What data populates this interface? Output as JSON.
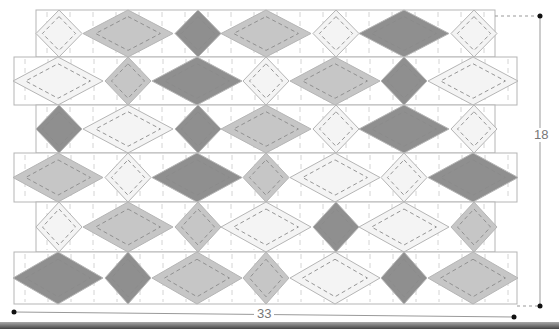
{
  "diagram": {
    "type": "quilt-layout",
    "dimensions": {
      "width_label": "33",
      "height_label": "18"
    },
    "colors": {
      "dark": "#8f8f8f",
      "medium": "#c6c6c6",
      "light": "#f4f4f4",
      "outline": "#b5b5b5",
      "stitch": "#8a8a8a",
      "grid": "#c9c9c9"
    },
    "rows": [
      {
        "x0": 36,
        "x1": 495,
        "y0": 10,
        "y1": 57,
        "pieces": [
          [
            "light",
            "s"
          ],
          [
            "medium",
            "l"
          ],
          [
            "dark",
            "s"
          ],
          [
            "medium",
            "l"
          ],
          [
            "light",
            "s"
          ],
          [
            "dark",
            "l"
          ],
          [
            "light",
            "s"
          ]
        ]
      },
      {
        "x0": 14,
        "x1": 517,
        "y0": 57,
        "y1": 105,
        "pieces": [
          [
            "light",
            "l"
          ],
          [
            "medium",
            "s"
          ],
          [
            "dark",
            "l"
          ],
          [
            "light",
            "s"
          ],
          [
            "medium",
            "l"
          ],
          [
            "dark",
            "s"
          ],
          [
            "light",
            "l"
          ]
        ]
      },
      {
        "x0": 36,
        "x1": 495,
        "y0": 105,
        "y1": 153,
        "pieces": [
          [
            "dark",
            "s"
          ],
          [
            "light",
            "l"
          ],
          [
            "dark",
            "s"
          ],
          [
            "medium",
            "l"
          ],
          [
            "light",
            "s"
          ],
          [
            "dark",
            "l"
          ],
          [
            "light",
            "s"
          ]
        ]
      },
      {
        "x0": 14,
        "x1": 517,
        "y0": 153,
        "y1": 202,
        "pieces": [
          [
            "medium",
            "l"
          ],
          [
            "light",
            "s"
          ],
          [
            "dark",
            "l"
          ],
          [
            "medium",
            "s"
          ],
          [
            "light",
            "l"
          ],
          [
            "light",
            "s"
          ],
          [
            "dark",
            "l"
          ]
        ]
      },
      {
        "x0": 36,
        "x1": 495,
        "y0": 202,
        "y1": 252,
        "pieces": [
          [
            "light",
            "s"
          ],
          [
            "medium",
            "l"
          ],
          [
            "medium",
            "s"
          ],
          [
            "light",
            "l"
          ],
          [
            "dark",
            "s"
          ],
          [
            "light",
            "l"
          ],
          [
            "medium",
            "s"
          ]
        ]
      },
      {
        "x0": 14,
        "x1": 517,
        "y0": 252,
        "y1": 304,
        "pieces": [
          [
            "dark",
            "l"
          ],
          [
            "dark",
            "s"
          ],
          [
            "medium",
            "l"
          ],
          [
            "medium",
            "s"
          ],
          [
            "light",
            "l"
          ],
          [
            "dark",
            "s"
          ],
          [
            "medium",
            "l"
          ]
        ]
      }
    ],
    "column_centers": [
      58,
      128,
      197,
      266,
      335,
      404,
      473
    ]
  }
}
